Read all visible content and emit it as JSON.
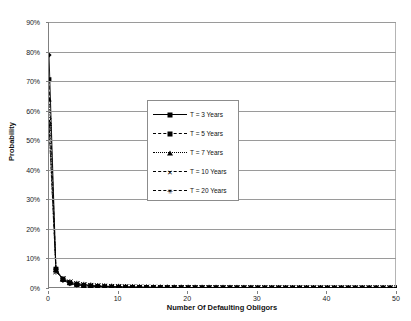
{
  "chart_data": {
    "type": "line",
    "title": "",
    "xlabel": "Number Of Defaulting Obligors",
    "ylabel": "Probability",
    "xlim": [
      0,
      50
    ],
    "ylim": [
      0,
      0.9
    ],
    "grid": true,
    "legend_position": "inside-upper-center",
    "x_ticks": [
      "0",
      "10",
      "20",
      "30",
      "40",
      "50"
    ],
    "x_tick_values": [
      0,
      10,
      20,
      30,
      40,
      50
    ],
    "y_ticks": [
      "0%",
      "10%",
      "20%",
      "30%",
      "40%",
      "50%",
      "60%",
      "70%",
      "80%",
      "90%"
    ],
    "y_tick_values": [
      0,
      10,
      20,
      30,
      40,
      50,
      60,
      70,
      80,
      90
    ],
    "x": [
      0,
      1,
      2,
      3,
      4,
      5,
      6,
      7,
      8,
      9,
      10,
      11,
      12,
      13,
      14,
      15,
      16,
      17,
      18,
      19,
      20,
      21,
      22,
      23,
      24,
      25,
      26,
      27,
      28,
      29,
      30,
      31,
      32,
      33,
      34,
      35,
      36,
      37,
      38,
      39,
      40,
      41,
      42,
      43,
      44,
      45,
      46,
      47,
      48,
      49,
      50
    ],
    "series": [
      {
        "name": "T = 3 Years",
        "marker": "diamond",
        "linestyle": "solid",
        "color": "#000000",
        "values": [
          78.8,
          6.2,
          2.6,
          1.5,
          1.0,
          0.75,
          0.58,
          0.47,
          0.38,
          0.32,
          0.27,
          0.23,
          0.2,
          0.18,
          0.16,
          0.14,
          0.13,
          0.115,
          0.1,
          0.095,
          0.085,
          0.08,
          0.072,
          0.066,
          0.06,
          0.056,
          0.052,
          0.048,
          0.045,
          0.042,
          0.039,
          0.036,
          0.034,
          0.032,
          0.03,
          0.028,
          0.027,
          0.025,
          0.024,
          0.023,
          0.022,
          0.021,
          0.02,
          0.019,
          0.018,
          0.017,
          0.016,
          0.015,
          0.015,
          0.014,
          0.013
        ]
      },
      {
        "name": "T = 5 Years",
        "marker": "square",
        "linestyle": "dashed",
        "color": "#000000",
        "values": [
          70.5,
          6.4,
          2.9,
          1.7,
          1.15,
          0.85,
          0.66,
          0.53,
          0.44,
          0.37,
          0.31,
          0.27,
          0.24,
          0.21,
          0.19,
          0.17,
          0.155,
          0.14,
          0.125,
          0.115,
          0.105,
          0.095,
          0.088,
          0.081,
          0.075,
          0.07,
          0.065,
          0.06,
          0.056,
          0.053,
          0.049,
          0.046,
          0.043,
          0.041,
          0.038,
          0.036,
          0.034,
          0.032,
          0.031,
          0.029,
          0.028,
          0.026,
          0.025,
          0.024,
          0.023,
          0.022,
          0.021,
          0.02,
          0.019,
          0.018,
          0.017
        ]
      },
      {
        "name": "T = 7 Years",
        "marker": "triangle",
        "linestyle": "dotted",
        "color": "#000000",
        "values": [
          64.0,
          6.3,
          3.1,
          1.9,
          1.3,
          0.95,
          0.74,
          0.6,
          0.5,
          0.42,
          0.36,
          0.31,
          0.27,
          0.24,
          0.215,
          0.19,
          0.175,
          0.16,
          0.145,
          0.13,
          0.12,
          0.11,
          0.1,
          0.094,
          0.087,
          0.081,
          0.076,
          0.071,
          0.066,
          0.062,
          0.058,
          0.054,
          0.051,
          0.048,
          0.045,
          0.043,
          0.04,
          0.038,
          0.036,
          0.034,
          0.033,
          0.031,
          0.03,
          0.028,
          0.027,
          0.026,
          0.025,
          0.024,
          0.023,
          0.022,
          0.021
        ]
      },
      {
        "name": "T = 10 Years",
        "marker": "x",
        "linestyle": "dashdot",
        "color": "#000000",
        "values": [
          56.5,
          5.9,
          3.2,
          2.0,
          1.45,
          1.1,
          0.86,
          0.7,
          0.58,
          0.49,
          0.42,
          0.37,
          0.32,
          0.29,
          0.26,
          0.23,
          0.21,
          0.19,
          0.175,
          0.16,
          0.15,
          0.138,
          0.128,
          0.119,
          0.111,
          0.104,
          0.097,
          0.091,
          0.085,
          0.08,
          0.075,
          0.071,
          0.067,
          0.063,
          0.06,
          0.057,
          0.054,
          0.051,
          0.048,
          0.046,
          0.044,
          0.042,
          0.04,
          0.038,
          0.036,
          0.035,
          0.033,
          0.032,
          0.03,
          0.029,
          0.028
        ]
      },
      {
        "name": "T = 20 Years",
        "marker": "star",
        "linestyle": "dashdot",
        "color": "#000000",
        "values": [
          55.0,
          5.5,
          3.1,
          2.0,
          1.48,
          1.14,
          0.9,
          0.74,
          0.62,
          0.53,
          0.46,
          0.4,
          0.35,
          0.31,
          0.28,
          0.25,
          0.23,
          0.21,
          0.19,
          0.18,
          0.165,
          0.153,
          0.142,
          0.132,
          0.124,
          0.116,
          0.109,
          0.102,
          0.096,
          0.091,
          0.086,
          0.081,
          0.077,
          0.073,
          0.069,
          0.066,
          0.063,
          0.06,
          0.057,
          0.054,
          0.052,
          0.05,
          0.047,
          0.045,
          0.043,
          0.042,
          0.04,
          0.038,
          0.037,
          0.035,
          0.034
        ]
      }
    ]
  },
  "axis": {
    "x_title": "Number Of Defaulting Obligors",
    "y_title": "Probability"
  },
  "legend": {
    "items": [
      {
        "label": "T = 3 Years",
        "marker": "diamond",
        "linestyle": "solid"
      },
      {
        "label": "T = 5 Years",
        "marker": "square",
        "linestyle": "dashed"
      },
      {
        "label": "T = 7 Years",
        "marker": "triangle",
        "linestyle": "dotted"
      },
      {
        "label": "T = 10 Years",
        "marker": "x",
        "linestyle": "dashdot"
      },
      {
        "label": "T = 20 Years",
        "marker": "star",
        "linestyle": "dashdot"
      }
    ]
  }
}
